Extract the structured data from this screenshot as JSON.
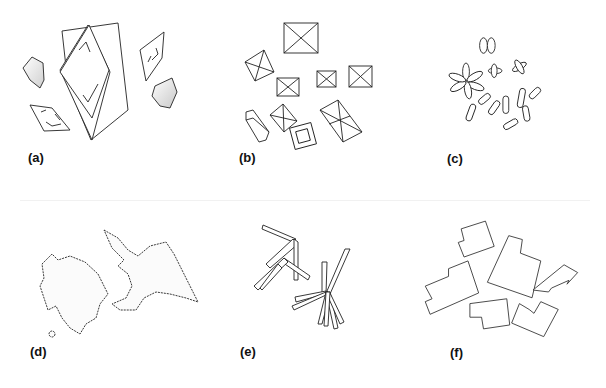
{
  "figure": {
    "background": "#ffffff",
    "stroke_color": "#222222",
    "panels": [
      {
        "id": "a",
        "label": "(a)",
        "description": "plate-like and rhombic crystals"
      },
      {
        "id": "b",
        "label": "(b)",
        "description": "octahedral / pyramidal crystals"
      },
      {
        "id": "c",
        "label": "(c)",
        "description": "rod and rosette shaped particles"
      },
      {
        "id": "d",
        "label": "(d)",
        "description": "irregular dendritic agglomerates"
      },
      {
        "id": "e",
        "label": "(e)",
        "description": "needle / lath clusters"
      },
      {
        "id": "f",
        "label": "(f)",
        "description": "angular stepped plates"
      }
    ]
  }
}
